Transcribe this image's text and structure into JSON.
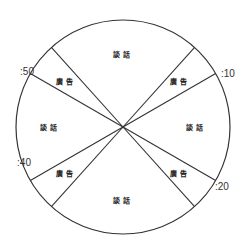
{
  "diagram": {
    "type": "clock-pie",
    "center": [
      123,
      127
    ],
    "radius": 107,
    "colors": {
      "stroke": "#333333",
      "text": "#222222",
      "background": "#ffffff"
    },
    "segments": [
      {
        "label": "談話",
        "start_min": 53,
        "end_min": 67,
        "kind": "talk"
      },
      {
        "label": "廣告",
        "start_min": 7,
        "end_min": 10,
        "kind": "ad"
      },
      {
        "label": "談話",
        "start_min": 10,
        "end_min": 20,
        "kind": "talk"
      },
      {
        "label": "廣告",
        "start_min": 20,
        "end_min": 23,
        "kind": "ad"
      },
      {
        "label": "談話",
        "start_min": 23,
        "end_min": 37,
        "kind": "talk"
      },
      {
        "label": "廣告",
        "start_min": 37,
        "end_min": 40,
        "kind": "ad"
      },
      {
        "label": "談話",
        "start_min": 40,
        "end_min": 50,
        "kind": "talk"
      },
      {
        "label": "廣告",
        "start_min": 50,
        "end_min": 53,
        "kind": "ad"
      }
    ],
    "divider_minutes": [
      7,
      10,
      20,
      23,
      37,
      40,
      50,
      53
    ],
    "tick_labels": [
      {
        "text": ":10",
        "minute": 10,
        "x": 221,
        "y": 77,
        "anchor": "start"
      },
      {
        "text": ":20",
        "minute": 20,
        "x": 215,
        "y": 190,
        "anchor": "start"
      },
      {
        "text": ":40",
        "minute": 40,
        "x": 31,
        "y": 166,
        "anchor": "end"
      },
      {
        "text": ":50",
        "minute": 50,
        "x": 34,
        "y": 75,
        "anchor": "end"
      }
    ]
  }
}
